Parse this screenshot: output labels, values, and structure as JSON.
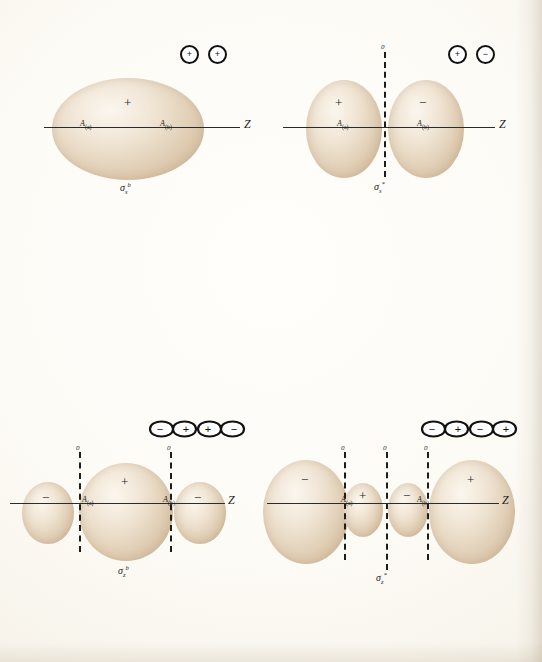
{
  "figure": {
    "type": "molecular-orbital-contour-plate",
    "columns": [
      "bonding",
      "antibonding"
    ],
    "background_color": "#fdfcf8",
    "lobe_color": "#e3d2ba",
    "ink_color": "#1c1c1c"
  },
  "labels": {
    "axis_z": "Z",
    "axis_x": "X",
    "node_zero": "0",
    "nucleus_a": "A",
    "nucleus_a_sub": "(a)",
    "nucleus_b": "A",
    "nucleus_b_sub": "(b)",
    "plus": "+",
    "minus": "−"
  },
  "panels": [
    {
      "id": "sigma-s-bonding",
      "row": 1,
      "column": "bonding",
      "orbital_symbol": "σ",
      "orbital_sub": "s",
      "orbital_sup": "b",
      "orbital_name": "sigma-s bonding",
      "lobe_count": 1,
      "lobe_signs": [
        "+"
      ],
      "nodal_planes": 0,
      "ao_icons": [
        {
          "shape": "s",
          "sign": "+"
        },
        {
          "shape": "s",
          "sign": "+"
        }
      ]
    },
    {
      "id": "sigma-s-antibonding",
      "row": 1,
      "column": "antibonding",
      "orbital_symbol": "σ",
      "orbital_sub": "s",
      "orbital_sup": "*",
      "orbital_name": "sigma-s antibonding",
      "lobe_count": 2,
      "lobe_signs": [
        "+",
        "−"
      ],
      "nodal_planes": 1,
      "ao_icons": [
        {
          "shape": "s",
          "sign": "+"
        },
        {
          "shape": "s",
          "sign": "−"
        }
      ]
    },
    {
      "id": "sigma-z-bonding",
      "row": 2,
      "column": "bonding",
      "orbital_symbol": "σ",
      "orbital_sub": "z",
      "orbital_sup": "b",
      "orbital_name": "sigma-z bonding",
      "lobe_count": 3,
      "lobe_signs": [
        "−",
        "+",
        "−"
      ],
      "nodal_planes": 2,
      "ao_icons": [
        {
          "shape": "p-horizontal",
          "sign_left": "−",
          "sign_right": "+"
        },
        {
          "shape": "p-horizontal",
          "sign_left": "+",
          "sign_right": "−"
        }
      ]
    },
    {
      "id": "sigma-z-antibonding",
      "row": 2,
      "column": "antibonding",
      "orbital_symbol": "σ",
      "orbital_sub": "z",
      "orbital_sup": "*",
      "orbital_name": "sigma-z antibonding",
      "lobe_count": 4,
      "lobe_signs": [
        "−",
        "+",
        "−",
        "+"
      ],
      "nodal_planes": 3,
      "ao_icons": [
        {
          "shape": "p-horizontal",
          "sign_left": "−",
          "sign_right": "+"
        },
        {
          "shape": "p-horizontal",
          "sign_left": "−",
          "sign_right": "+"
        }
      ]
    },
    {
      "id": "pi-x-bonding",
      "row": 3,
      "column": "bonding",
      "orbital_symbol": "π",
      "orbital_sub": "x",
      "orbital_sup": "b",
      "orbital_name": "pi-x bonding",
      "lobe_count": 2,
      "lobe_signs": [
        "+",
        "−"
      ],
      "nodal_planes": 1,
      "nodal_orientation": "horizontal",
      "ao_icons": [
        {
          "shape": "p-vertical",
          "sign_top": "+",
          "sign_bottom": "−"
        },
        {
          "shape": "p-vertical",
          "sign_top": "+",
          "sign_bottom": "−"
        }
      ]
    },
    {
      "id": "pi-x-antibonding",
      "row": 3,
      "column": "antibonding",
      "orbital_symbol": "π",
      "orbital_sub": "x",
      "orbital_sup": "*",
      "orbital_name": "pi-x antibonding",
      "lobe_count": 4,
      "lobe_signs": [
        "+",
        "−",
        "−",
        "+"
      ],
      "nodal_planes": 2,
      "nodal_orientation": "horizontal-and-vertical",
      "ao_icons": [
        {
          "shape": "p-vertical",
          "sign_top": "+",
          "sign_bottom": "−"
        },
        {
          "shape": "p-vertical",
          "sign_top": "−",
          "sign_bottom": "+"
        }
      ]
    }
  ]
}
